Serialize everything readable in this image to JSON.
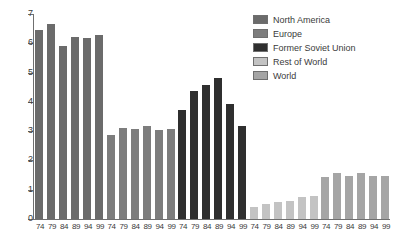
{
  "chart_data": {
    "type": "bar",
    "title": "",
    "subtitle": "",
    "xlabel": "",
    "ylabel": "",
    "ylim": [
      0,
      7
    ],
    "ytick_labels": [
      "0",
      "1",
      "2",
      "3",
      "4",
      "5",
      "6",
      "7"
    ],
    "yticks": [
      0,
      1,
      2,
      3,
      4,
      5,
      6,
      7
    ],
    "grid": false,
    "legend_position": "top-right",
    "categories": [
      "74",
      "79",
      "84",
      "89",
      "94",
      "99"
    ],
    "series": [
      {
        "name": "North America",
        "color": "#6b6b6b",
        "values": [
          6.5,
          6.7,
          5.95,
          6.25,
          6.22,
          6.32
        ]
      },
      {
        "name": "Europe",
        "color": "#7d7d7d",
        "values": [
          2.9,
          3.15,
          3.1,
          3.2,
          3.08,
          3.12
        ]
      },
      {
        "name": "Former Soviet Union",
        "color": "#2f2f2f",
        "values": [
          3.75,
          4.4,
          4.62,
          4.85,
          3.95,
          3.2
        ]
      },
      {
        "name": "Rest of World",
        "color": "#c3c3c3",
        "values": [
          0.45,
          0.55,
          0.6,
          0.65,
          0.78,
          0.82
        ]
      },
      {
        "name": "World",
        "color": "#a5a5a5",
        "values": [
          1.48,
          1.6,
          1.52,
          1.6,
          1.52,
          1.52
        ]
      }
    ]
  },
  "legend": {
    "items": [
      {
        "label": "North America",
        "color": "#6b6b6b"
      },
      {
        "label": "Europe",
        "color": "#7d7d7d"
      },
      {
        "label": "Former Soviet Union",
        "color": "#2f2f2f"
      },
      {
        "label": "Rest of World",
        "color": "#c3c3c3"
      },
      {
        "label": "World",
        "color": "#a5a5a5"
      }
    ]
  },
  "axis": {
    "line_color": "#6f6f6f",
    "text_color": "#3b3b3b"
  }
}
